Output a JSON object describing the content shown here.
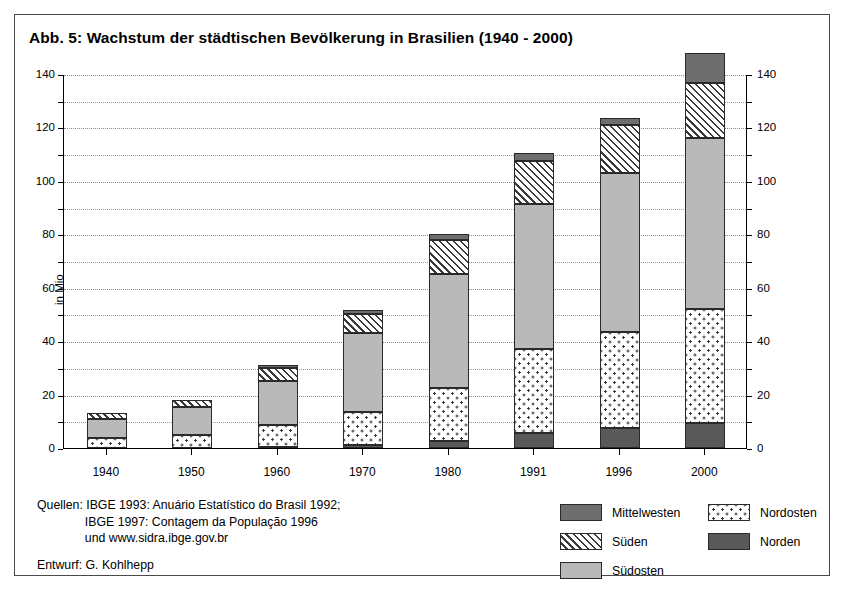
{
  "figure": {
    "title": "Abb. 5: Wachstum der städtischen Bevölkerung in Brasilien (1940 - 2000)",
    "sources": "Quellen: IBGE 1993: Anuário Estatístico do Brasil 1992;\n              IBGE 1997: Contagem da População 1996\n              und www.sidra.ibge.gov.br",
    "author": "Entwurf: G. Kohlhepp"
  },
  "legend": {
    "items": [
      {
        "label": "Mittelwesten",
        "key": "mittelwesten",
        "color": "#6e6e6e",
        "pattern": "solid-dark-gray",
        "col": 0,
        "row": 0
      },
      {
        "label": "Nordosten",
        "key": "nordosten",
        "color": "#ffffff",
        "pattern": "dotted",
        "col": 1,
        "row": 0
      },
      {
        "label": "Süden",
        "key": "sueden",
        "color": "#ffffff",
        "pattern": "diagonal-hatch",
        "col": 0,
        "row": 1
      },
      {
        "label": "Norden",
        "key": "norden",
        "color": "#595959",
        "pattern": "solid-darker",
        "col": 1,
        "row": 1
      },
      {
        "label": "Südosten",
        "key": "suedosten",
        "color": "#b9b9b9",
        "pattern": "solid-light-gray",
        "col": 0,
        "row": 2
      }
    ]
  },
  "chart_data": {
    "type": "bar",
    "subtype": "stacked",
    "title": "Abb. 5: Wachstum der städtischen Bevölkerung in Brasilien (1940 - 2000)",
    "xlabel": "",
    "ylabel": "in Mio",
    "ylim": [
      0,
      140
    ],
    "ytick_step": 20,
    "minor_grid_step": 10,
    "grid": true,
    "dual_y_axis": true,
    "legend_position": "bottom-right",
    "categories": [
      "1940",
      "1950",
      "1960",
      "1970",
      "1980",
      "1991",
      "1996",
      "2000"
    ],
    "yticks": [
      0,
      20,
      40,
      60,
      80,
      100,
      120,
      140
    ],
    "stack_order_bottom_to_top": [
      "Norden",
      "Nordosten",
      "Südosten",
      "Süden",
      "Mittelwesten"
    ],
    "series": [
      {
        "name": "Norden",
        "key": "norden",
        "values": [
          0.0,
          0.0,
          0.5,
          1.0,
          2.5,
          5.5,
          7.5,
          9.5
        ]
      },
      {
        "name": "Nordosten",
        "key": "nordosten",
        "values": [
          3.8,
          5.0,
          8.0,
          12.5,
          20.0,
          31.5,
          36.0,
          42.5
        ]
      },
      {
        "name": "Südosten",
        "key": "suedosten",
        "values": [
          7.2,
          10.5,
          16.5,
          29.5,
          42.5,
          54.5,
          59.5,
          64.0
        ]
      },
      {
        "name": "Süden",
        "key": "sueden",
        "values": [
          2.0,
          2.5,
          5.0,
          7.0,
          13.0,
          16.0,
          18.0,
          20.5
        ]
      },
      {
        "name": "Mittelwesten",
        "key": "mittelwesten",
        "values": [
          0.0,
          0.0,
          1.0,
          1.5,
          2.0,
          3.0,
          2.5,
          11.5
        ]
      }
    ],
    "totals": [
      13.0,
      18.0,
      31.0,
      51.5,
      80.0,
      110.5,
      123.5,
      148.0
    ]
  }
}
